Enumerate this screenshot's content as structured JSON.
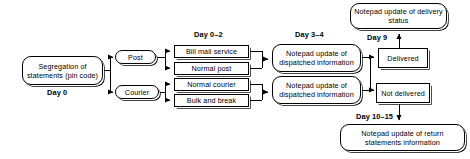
{
  "diagram": {
    "colors": {
      "line": "#000000",
      "box_fill": "#ffffff",
      "text": "#000000",
      "shadow": "#000000"
    },
    "nodes": {
      "segregation": "Segregation of statements (pin code)",
      "post": "Post",
      "courier": "Courier",
      "bill_mail_service": "Bill mail service",
      "normal_post": "Normal post",
      "normal_courier": "Normal courier",
      "bulk_and_break": "Bulk and break",
      "notepad_dispatch_post": "Notepad update of dispatched information",
      "notepad_dispatch_courier": "Notepad update of dispatched information",
      "delivered": "Delivered",
      "not_delivered": "Not delivered",
      "notepad_delivery_status": "Notepad update of delivery status",
      "notepad_return_statements": "Notepad update of return statements information"
    },
    "day_labels": {
      "day_0": "Day 0",
      "day_0_2": "Day 0–2",
      "day_3_4": "Day 3–4",
      "day_9": "Day 9",
      "day_10_15": "Day 10–15"
    }
  }
}
